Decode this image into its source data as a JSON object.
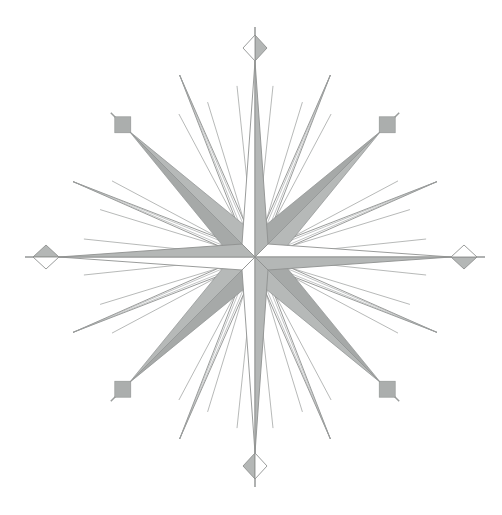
{
  "scene": {
    "width": 502,
    "height": 515,
    "background": "#ffffff",
    "label": "compass-rose"
  },
  "center": {
    "x": 255,
    "y": 257
  },
  "colors": {
    "white": "#ffffff",
    "shade": "#b4b7b6",
    "ordinal_dark": "#a6a9a8",
    "ordinal_light": "#b6b9b8",
    "square": "#abaead",
    "outline": "#8e9190",
    "spike_outline": "#9b9e9d",
    "hairline": "#a4a7a6"
  },
  "cardinal": {
    "arm_length": 196,
    "base_half": 13,
    "stroke_width": 0.9,
    "finial_shaded_side": "right",
    "diamond": {
      "half_long": 13,
      "half_short": 12,
      "spike_start": 7,
      "spike_end": 21,
      "spike_width": 1.6
    },
    "points": [
      {
        "name": "north",
        "angle": 0,
        "shaded_side": "right"
      },
      {
        "name": "east",
        "angle": 90,
        "shaded_side": "right"
      },
      {
        "name": "south",
        "angle": 180,
        "shaded_side": "left"
      },
      {
        "name": "west",
        "angle": 270,
        "shaded_side": "right"
      }
    ]
  },
  "ordinal": {
    "wedge_length": 178,
    "base_half": 18,
    "square_radius": 187,
    "square_half": 8,
    "outer_spike_len": 17,
    "connector_width": 1.2,
    "dark_side": "left",
    "points": [
      {
        "name": "north-east",
        "angle": 45
      },
      {
        "name": "south-east",
        "angle": 135
      },
      {
        "name": "south-west",
        "angle": 225
      },
      {
        "name": "north-west",
        "angle": 315
      }
    ]
  },
  "half_winds": {
    "length": 197,
    "base_half": 4.5,
    "inner_line_offset": 2,
    "stroke_width": 0.9,
    "points": [
      {
        "name": "nne",
        "angle": 22.5
      },
      {
        "name": "ene",
        "angle": 67.5
      },
      {
        "name": "ese",
        "angle": 112.5
      },
      {
        "name": "sse",
        "angle": 157.5
      },
      {
        "name": "ssw",
        "angle": 202.5
      },
      {
        "name": "wsw",
        "angle": 247.5
      },
      {
        "name": "wnw",
        "angle": 292.5
      },
      {
        "name": "nnw",
        "angle": 337.5
      }
    ]
  },
  "hairlines": {
    "cardinal_spread_deg": 6,
    "cardinal_length": 172,
    "half_wind_spread_deg": 5.5,
    "half_wind_length": 162,
    "inner_radius": 16,
    "width": 0.8
  }
}
